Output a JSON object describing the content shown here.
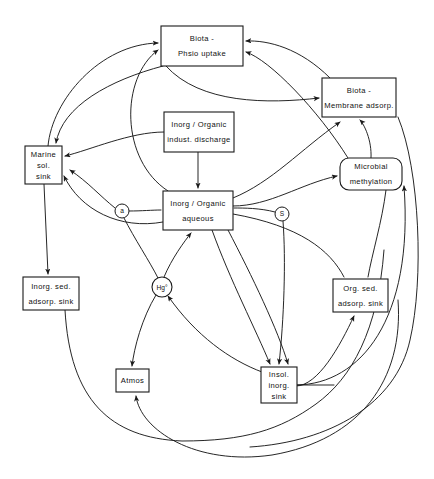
{
  "diagram": {
    "background_color": "#ffffff",
    "line_color": "#1a1a1a",
    "nodes": [
      {
        "id": "biota-physio-uptake",
        "shape": "rect",
        "lines": [
          "Biota  -",
          "Phsio   uptake"
        ],
        "x": 161,
        "y": 26,
        "w": 82,
        "h": 40
      },
      {
        "id": "biota-membrane-adsorp",
        "shape": "rect",
        "lines": [
          "Biota  -",
          "Membrane  adsorp."
        ],
        "x": 322,
        "y": 78,
        "w": 74,
        "h": 39
      },
      {
        "id": "inorg-organic-indust-discharge",
        "shape": "rect",
        "lines": [
          "Inorg / Organic",
          "indust. discharge"
        ],
        "x": 164,
        "y": 112,
        "w": 70,
        "h": 40
      },
      {
        "id": "marine-sol-sink",
        "shape": "rect",
        "lines": [
          "Marine",
          "sol.",
          "sink"
        ],
        "x": 25,
        "y": 146,
        "w": 37,
        "h": 38
      },
      {
        "id": "microbial-methylation",
        "shape": "roundrect",
        "lines": [
          "Microbial",
          "methylation"
        ],
        "x": 340,
        "y": 158,
        "w": 62,
        "h": 32
      },
      {
        "id": "inorg-organic-aqueous",
        "shape": "rect",
        "lines": [
          "Inorg / Organic",
          "aqueous"
        ],
        "x": 163,
        "y": 191,
        "w": 70,
        "h": 39
      },
      {
        "id": "inorg-sed-adsorp-sink",
        "shape": "rect",
        "lines": [
          "Inorg. sed.",
          "adsorp. sink"
        ],
        "x": 23,
        "y": 277,
        "w": 56,
        "h": 33
      },
      {
        "id": "org-sed-adsorp-sink",
        "shape": "rect",
        "lines": [
          "Org.  sed.",
          "adsorp. sink"
        ],
        "x": 333,
        "y": 279,
        "w": 55,
        "h": 33
      },
      {
        "id": "insol-inorg-sink",
        "shape": "rect",
        "lines": [
          "Insol.",
          "inorg.",
          "sink"
        ],
        "x": 261,
        "y": 367,
        "w": 36,
        "h": 36
      },
      {
        "id": "atmos",
        "shape": "rect",
        "lines": [
          "Atmos"
        ],
        "x": 116,
        "y": 369,
        "w": 33,
        "h": 23
      },
      {
        "id": "hg-elemental",
        "shape": "circle",
        "lines": [
          "Hg°"
        ],
        "cx": 162,
        "cy": 287,
        "r": 10
      }
    ],
    "markers": [
      {
        "id": "marker-a",
        "label": "a",
        "cx": 122,
        "cy": 211,
        "r": 7
      },
      {
        "id": "marker-s",
        "label": "S",
        "cx": 282,
        "cy": 214,
        "r": 7
      }
    ],
    "edges": [
      {
        "id": "edge-marine-to-physio",
        "from": "marine-sol-sink",
        "to": "biota-physio-uptake",
        "d": "M 48,146 C 52,100 100,44 158,43",
        "arrow": "end"
      },
      {
        "id": "edge-aqueous-to-physio-left",
        "from": "inorg-organic-aqueous",
        "to": "biota-physio-uptake",
        "d": "M 168,191 C 120,160 120,78 158,50",
        "arrow": "end"
      },
      {
        "id": "edge-membrane-to-physio",
        "from": "biota-membrane-adsorp",
        "to": "biota-physio-uptake",
        "d": "M 330,78 C 300,48 268,40 246,41",
        "arrow": "end"
      },
      {
        "id": "edge-microbial-to-physio",
        "from": "microbial-methylation",
        "to": "biota-physio-uptake",
        "d": "M 348,158 C 318,110 270,60 246,52",
        "arrow": "end"
      },
      {
        "id": "edge-physio-to-membrane",
        "from": "biota-physio-uptake",
        "to": "biota-membrane-adsorp",
        "d": "M 166,66 C 200,104 268,104 319,98",
        "arrow": "end"
      },
      {
        "id": "edge-physio-to-marine",
        "from": "biota-physio-uptake",
        "to": "marine-sol-sink",
        "d": "M 163,66 C 110,80 62,106 56,143",
        "arrow": "end"
      },
      {
        "id": "edge-discharge-to-marine",
        "from": "inorg-organic-indust-discharge",
        "to": "marine-sol-sink",
        "d": "M 164,132 C 130,132 90,150 65,156",
        "arrow": "end"
      },
      {
        "id": "edge-discharge-to-aqueous",
        "from": "inorg-organic-indust-discharge",
        "to": "inorg-organic-aqueous",
        "d": "M 198,152 L 198,188",
        "arrow": "end"
      },
      {
        "id": "edge-aqueous-right-to-microbial",
        "from": "inorg-organic-aqueous",
        "to": "microbial-methylation",
        "d": "M 233,206 C 270,206 300,184 337,176",
        "arrow": "end"
      },
      {
        "id": "edge-insol-to-microbial",
        "from": "insol-inorg-sink",
        "to": "microbial-methylation",
        "d": "M 297,385 C 360,384 414,320 404,186",
        "arrow": "end"
      },
      {
        "id": "edge-microbial-to-membrane",
        "from": "microbial-methylation",
        "to": "biota-membrane-adsorp",
        "d": "M 371,158 C 372,140 364,124 360,120",
        "arrow": "end"
      },
      {
        "id": "edge-aqueous-to-membrane",
        "from": "inorg-organic-aqueous",
        "to": "biota-membrane-adsorp",
        "d": "M 233,198 C 272,182 300,150 340,122",
        "arrow": "end"
      },
      {
        "id": "edge-marker-a-to-aqueous",
        "from": "marker-a",
        "to": "inorg-organic-aqueous",
        "d": "M 129,211 C 142,211 152,210 161,210",
        "arrow": "none"
      },
      {
        "id": "edge-aqueous-to-marker-a",
        "from": "inorg-organic-aqueous",
        "to": "marker-a",
        "d": "M 115,208 C 100,196 88,182 70,170",
        "arrow": "end"
      },
      {
        "id": "edge-marker-a-down",
        "from": "marker-a",
        "to": "hg-elemental",
        "d": "M 124,218 C 134,238 150,262 158,278",
        "arrow": "none"
      },
      {
        "id": "edge-marker-s-to-aqueous",
        "from": "marker-s",
        "to": "inorg-organic-aqueous",
        "d": "M 275,212 C 260,208 244,208 234,208",
        "arrow": "none"
      },
      {
        "id": "edge-marker-s-down",
        "from": "marker-s",
        "to": "insol-inorg-sink",
        "d": "M 283,221 C 286,260 284,320 279,364",
        "arrow": "end"
      },
      {
        "id": "edge-marine-to-inorg-sed",
        "from": "marine-sol-sink",
        "to": "inorg-sed-adsorp-sink",
        "d": "M 44,184 L 48,274",
        "arrow": "end"
      },
      {
        "id": "edge-aqueous-to-marine-lower",
        "from": "inorg-organic-aqueous",
        "to": "marine-sol-sink",
        "d": "M 163,222 C 120,230 80,210 64,176",
        "arrow": "end"
      },
      {
        "id": "edge-hg-to-aqueous",
        "from": "hg-elemental",
        "to": "inorg-organic-aqueous",
        "d": "M 164,277 C 172,258 184,242 191,233",
        "arrow": "end"
      },
      {
        "id": "edge-hg-to-atmos",
        "from": "hg-elemental",
        "to": "atmos",
        "d": "M 156,295 C 142,318 134,348 132,366",
        "arrow": "end"
      },
      {
        "id": "edge-insol-to-hg",
        "from": "insol-inorg-sink",
        "to": "hg-elemental",
        "d": "M 262,372 C 230,360 196,336 168,296",
        "arrow": "end"
      },
      {
        "id": "edge-aqueous-to-insol-a",
        "from": "inorg-organic-aqueous",
        "to": "insol-inorg-sink",
        "d": "M 212,230 C 230,280 256,330 270,364",
        "arrow": "end"
      },
      {
        "id": "edge-aqueous-to-insol-b",
        "from": "inorg-organic-aqueous",
        "to": "insol-inorg-sink",
        "d": "M 228,230 C 252,276 278,330 288,364",
        "arrow": "end"
      },
      {
        "id": "edge-insol-to-org-sed",
        "from": "insol-inorg-sink",
        "to": "org-sed-adsorp-sink",
        "d": "M 296,386 C 318,386 340,346 354,316",
        "arrow": "end"
      },
      {
        "id": "edge-microbial-to-org-sed",
        "from": "microbial-methylation",
        "to": "org-sed-adsorp-sink",
        "d": "M 386,190 C 382,222 372,254 368,277",
        "arrow": "none"
      },
      {
        "id": "edge-right-loop-to-org-sed",
        "from": "inorg-organic-aqueous",
        "to": "org-sed-adsorp-sink",
        "d": "M 233,214 C 300,226 330,250 344,277",
        "arrow": "none"
      },
      {
        "id": "edge-insol-right-stub",
        "from": "insol-inorg-sink",
        "to": "outer-loop",
        "d": "M 297,385 L 334,385",
        "arrow": "none"
      },
      {
        "id": "edge-outer-bottom-to-atmos",
        "from": "inorg-sed-adsorp-sink",
        "to": "atmos",
        "d": "M 65,310 C 70,400 110,438 182,441 C 244,441 280,430 316,404 C 352,378 378,330 384,250",
        "arrow": "none"
      },
      {
        "id": "edge-bottom-long-to-atmos",
        "from": "outer-loop",
        "to": "atmos",
        "d": "M 398,300 C 404,380 360,440 272,455 C 196,466 140,430 136,396",
        "arrow": "end"
      },
      {
        "id": "edge-outer-right-loop",
        "from": "biota-membrane-adsorp",
        "to": "outer-loop",
        "d": "M 398,117 C 420,170 424,280 410,340 C 396,404 330,442 250,447",
        "arrow": "none"
      }
    ]
  }
}
